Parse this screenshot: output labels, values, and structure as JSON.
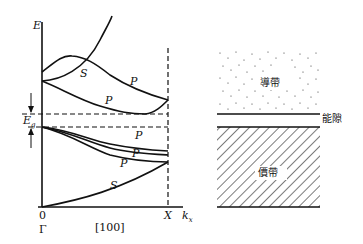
{
  "band_structure": {
    "axis_y_label": "E",
    "axis_x_label": "k",
    "axis_x_subscript": "x",
    "gap_label": "E",
    "gap_label_subscript": "g",
    "origin_label": "0",
    "gamma_label": "Γ",
    "direction_label": "[100]",
    "x_point_label": "X",
    "curve_labels": {
      "s_upper": "S",
      "p_upper_1": "P",
      "p_upper_2": "P",
      "p_lower_1": "P",
      "p_lower_2": "P",
      "p_lower_3": "P",
      "s_lower": "S"
    }
  },
  "band_schematic": {
    "conduction_band": "導帶",
    "gap": "能隙",
    "valence_band": "價帶"
  }
}
